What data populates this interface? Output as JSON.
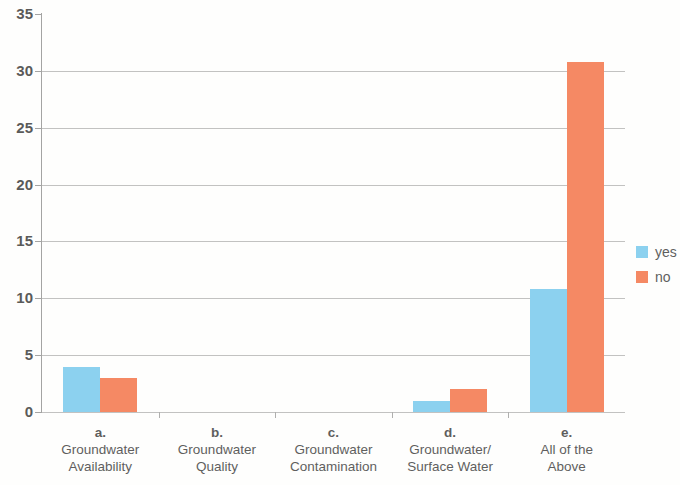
{
  "chart_data": {
    "type": "bar",
    "title": "",
    "subtitle": "",
    "xlabel": "",
    "ylabel": "",
    "ylim": [
      0,
      35
    ],
    "ytick_interval": 5,
    "yticks": [
      35,
      30,
      25,
      20,
      15,
      10,
      5,
      0
    ],
    "grid": true,
    "grid_axis": "y",
    "legend_position": "right",
    "categories": [
      "a. Groundwater Availability",
      "b. Groundwater Quality",
      "c. Groundwater Contamination",
      "d. Groundwater/ Surface Water",
      "e. All of the Above"
    ],
    "category_labels": [
      {
        "letter": "a.",
        "line1": "Groundwater",
        "line2": "Availability"
      },
      {
        "letter": "b.",
        "line1": "Groundwater",
        "line2": "Quality"
      },
      {
        "letter": "c.",
        "line1": "Groundwater",
        "line2": "Contamination"
      },
      {
        "letter": "d.",
        "line1": "Groundwater/",
        "line2": "Surface Water"
      },
      {
        "letter": "e.",
        "line1": "All of the",
        "line2": "Above"
      }
    ],
    "series": [
      {
        "name": "yes",
        "color": "#6ec6ed",
        "values": [
          4,
          0,
          0,
          1,
          10.8
        ]
      },
      {
        "name": "no",
        "color": "#f4693c",
        "values": [
          3,
          0,
          0,
          2,
          30.8
        ]
      }
    ]
  },
  "legend": {
    "items": [
      {
        "label": "yes",
        "color": "#6ec6ed"
      },
      {
        "label": "no",
        "color": "#f4693c"
      }
    ]
  }
}
